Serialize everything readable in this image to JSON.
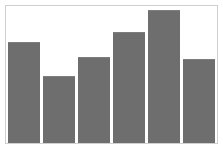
{
  "chart_data": {
    "type": "bar",
    "title": "",
    "subtitle": "",
    "xlabel": "",
    "ylabel": "",
    "categories": [
      "1",
      "2",
      "3",
      "4",
      "5",
      "6"
    ],
    "values": [
      74,
      49,
      63,
      81,
      97,
      61
    ],
    "series": [
      {
        "name": "",
        "values": [
          74,
          49,
          63,
          81,
          97,
          61
        ]
      }
    ],
    "ylim": [
      0,
      100
    ],
    "xlim": [
      0,
      6
    ],
    "grid": false,
    "legend": false,
    "legend_position": "none",
    "xtick_labels": [],
    "ytick_labels": [],
    "annotations": [],
    "bar_color": "#6e6e6e",
    "plot_background": "#ffffff",
    "frame_color": "#cfcfcf",
    "figure_background": "#ffffff"
  }
}
